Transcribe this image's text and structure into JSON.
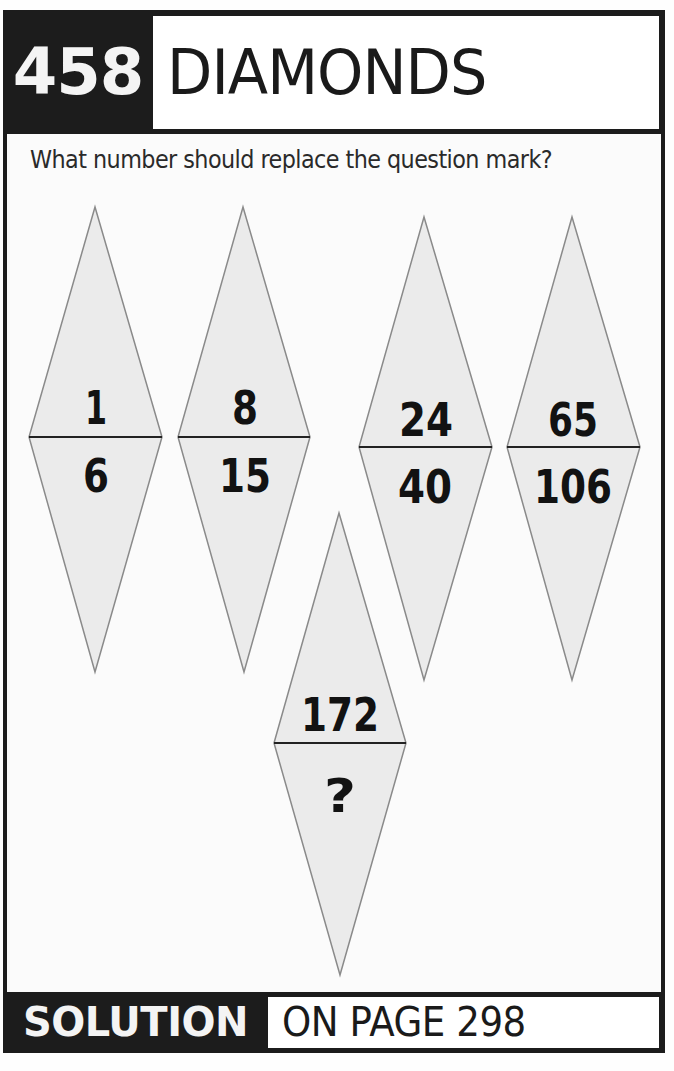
{
  "header": {
    "puzzle_number": "458",
    "title": "DIAMONDS"
  },
  "question": "What number should replace the question mark?",
  "diamonds": [
    {
      "top": "1",
      "bottom": "6"
    },
    {
      "top": "8",
      "bottom": "15"
    },
    {
      "top": "24",
      "bottom": "40"
    },
    {
      "top": "65",
      "bottom": "106"
    },
    {
      "top": "172",
      "bottom": "?"
    }
  ],
  "footer": {
    "label": "SOLUTION",
    "text": "ON PAGE 298"
  },
  "colors": {
    "frame": "#1c1c1c",
    "diamond_fill": "#ebebeb",
    "diamond_stroke": "#8a8a8a",
    "divider": "#222222"
  }
}
